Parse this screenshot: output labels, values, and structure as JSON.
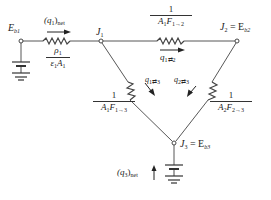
{
  "diagram": {
    "type": "radiation-network",
    "nodes": [
      {
        "id": "Eb1",
        "label": "E",
        "sub": "b1"
      },
      {
        "id": "J1",
        "label": "J",
        "sub": "1"
      },
      {
        "id": "J2",
        "label": "J",
        "sub": "2",
        "eq": "= E",
        "eq_sub": "b2"
      },
      {
        "id": "J3",
        "label": "J",
        "sub": "3",
        "eq": "= E",
        "eq_sub": "b3"
      }
    ],
    "resistors": [
      {
        "id": "r1",
        "from": "Eb1",
        "to": "J1",
        "num": "ρ",
        "num_sub": "1",
        "den": "ε",
        "den_sub1": "1",
        "den_mid": "A",
        "den_sub2": "1"
      },
      {
        "id": "r12",
        "from": "J1",
        "to": "J2",
        "num": "1",
        "den": "A₁F₁→₂"
      },
      {
        "id": "r13",
        "from": "J1",
        "to": "J3",
        "num": "1",
        "den": "A₁F₁→₃"
      },
      {
        "id": "r23",
        "from": "J2",
        "to": "J3",
        "num": "1",
        "den": "A₂F₂→₃"
      }
    ],
    "flows": [
      {
        "id": "q1net",
        "label": "(q",
        "sub": "1",
        "close": ")",
        "tail": "net"
      },
      {
        "id": "q12",
        "label": "q",
        "sub": "1⇄2"
      },
      {
        "id": "q13",
        "label": "q",
        "sub": "1⇄3"
      },
      {
        "id": "q23",
        "label": "q",
        "sub": "2⇄3"
      },
      {
        "id": "q3net",
        "label": "(q",
        "sub": "3",
        "close": ")",
        "tail": "net"
      }
    ],
    "labels": {
      "eb1_main": "E",
      "eb1_sub": "b1",
      "j1_main": "J",
      "j1_sub": "1",
      "j2_main": "J",
      "j2_sub": "2",
      "j2_eq": " = E",
      "j2_eq_sub": "b2",
      "j3_main": "J",
      "j3_sub": "3",
      "j3_eq": " = E",
      "j3_eq_sub": "b3",
      "q1net_open": "(q",
      "q1net_sub": "1",
      "q1net_close": ")",
      "q1net_tail": "net",
      "r1_num": "ρ",
      "r1_num_sub": "1",
      "r1_den_a": "ε",
      "r1_den_sub1": "1",
      "r1_den_b": "A",
      "r1_den_sub2": "1",
      "r12_num": "1",
      "r12_den_a": "A",
      "r12_den_sub1": "1",
      "r12_den_b": "F",
      "r12_den_sub2": "1→2",
      "q12_main": "q",
      "q12_sub": "1⇄2",
      "q13_main": "q",
      "q13_sub": "1⇄3",
      "q23_main": "q",
      "q23_sub": "2⇄3",
      "r13_num": "1",
      "r13_den_a": "A",
      "r13_den_sub1": "1",
      "r13_den_b": "F",
      "r13_den_sub2": "1→3",
      "r23_num": "1",
      "r23_den_a": "A",
      "r23_den_sub1": "2",
      "r23_den_b": "F",
      "r23_den_sub2": "2→3",
      "q3net_open": "(q",
      "q3net_sub": "3",
      "q3net_close": ")",
      "q3net_tail": "net"
    },
    "colors": {
      "line": "#444444",
      "text": "#222222",
      "background": "#ffffff"
    }
  }
}
